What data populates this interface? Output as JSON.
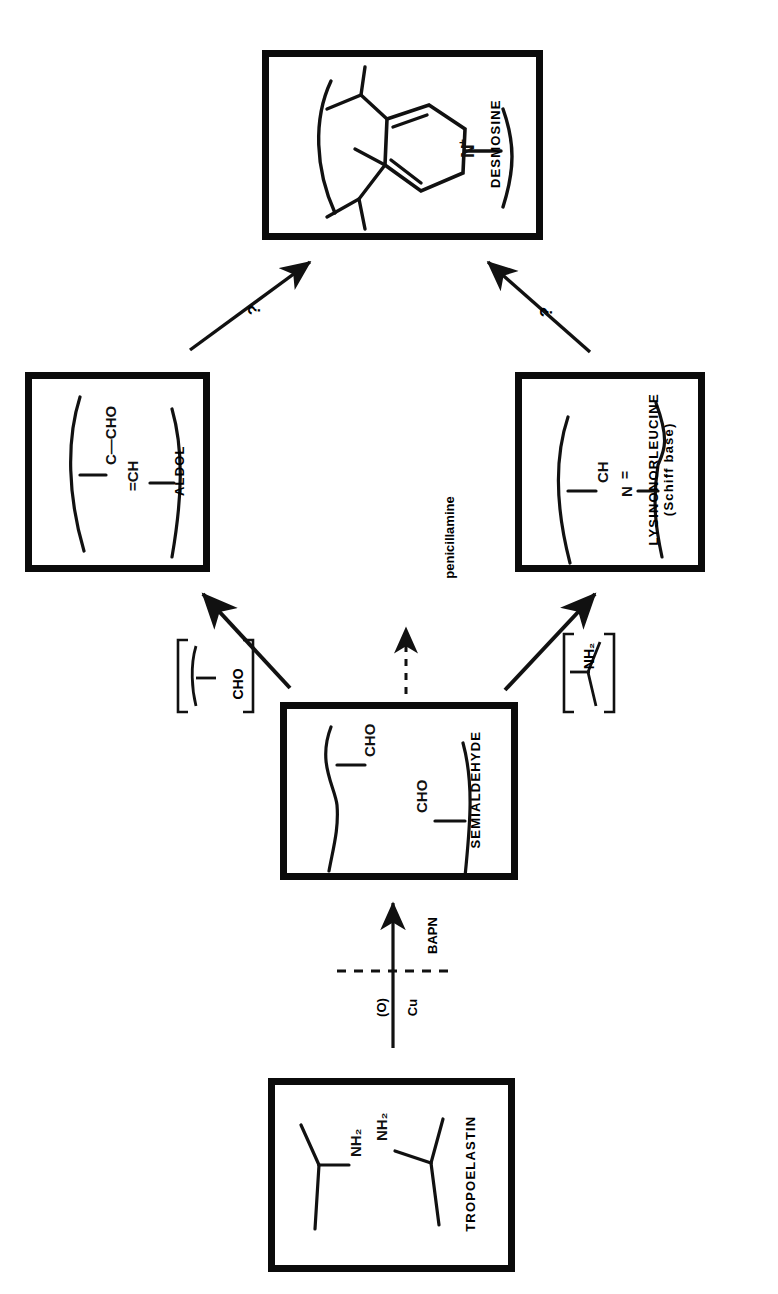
{
  "diagram": {
    "orientation": "rotated-90-ccw",
    "colors": {
      "ink": "#111111",
      "background": "#ffffff"
    }
  },
  "boxes": [
    {
      "id": "desmosine",
      "label": "DESMOSINE",
      "structure": "pyridinium-ring-with-four-chains",
      "atom_labels": [
        "N"
      ],
      "charge": "+"
    },
    {
      "id": "aldol",
      "label": "ALDOL",
      "structure": "aldol-condensation-product",
      "atom_labels": [
        "C—CHO",
        "=CH"
      ]
    },
    {
      "id": "lysinonorleucine",
      "label": "LYSINONORLEUCINE",
      "sublabel": "(Schiff base)",
      "structure": "schiff-base-linkage",
      "atom_labels": [
        "CH",
        "N"
      ],
      "bond": "="
    },
    {
      "id": "semialdehyde",
      "label": "SEMIALDEHYDE",
      "structure": "two-chains-bearing-aldehyde",
      "atom_labels": [
        "CHO",
        "CHO"
      ]
    },
    {
      "id": "tropoelastin",
      "label": "TROPOELASTIN",
      "structure": "two-chains-bearing-amine",
      "atom_labels": [
        "NH₂",
        "NH₂"
      ]
    }
  ],
  "intermediates": [
    {
      "id": "bracket-cho",
      "label": "CHO",
      "bracketed": true
    },
    {
      "id": "bracket-nh2",
      "label": "NH₂",
      "bracketed": true
    }
  ],
  "arrows": [
    {
      "id": "tropoelastin-to-semialdehyde",
      "from": "tropoelastin",
      "to": "semialdehyde",
      "style": "solid",
      "cofactors": [
        "(O)",
        "Cu"
      ]
    },
    {
      "id": "semialdehyde-to-aldol",
      "from": "semialdehyde",
      "to": "aldol",
      "style": "solid",
      "label": ""
    },
    {
      "id": "semialdehyde-to-lysinonorleucine",
      "from": "semialdehyde",
      "to": "lysinonorleucine",
      "style": "solid",
      "label": ""
    },
    {
      "id": "aldol-to-desmosine",
      "from": "aldol",
      "to": "desmosine",
      "style": "solid",
      "label": "?"
    },
    {
      "id": "lysinonorleucine-to-desmosine",
      "from": "lysinonorleucine",
      "to": "desmosine",
      "style": "solid",
      "label": "?"
    }
  ],
  "inhibitors": [
    {
      "id": "bapn",
      "label": "BAPN",
      "style": "dashed-blocking-line",
      "blocks": "tropoelastin-to-semialdehyde"
    },
    {
      "id": "penicillamine",
      "label": "penicillamine",
      "style": "dashed-arrow",
      "target": "semialdehyde"
    }
  ]
}
